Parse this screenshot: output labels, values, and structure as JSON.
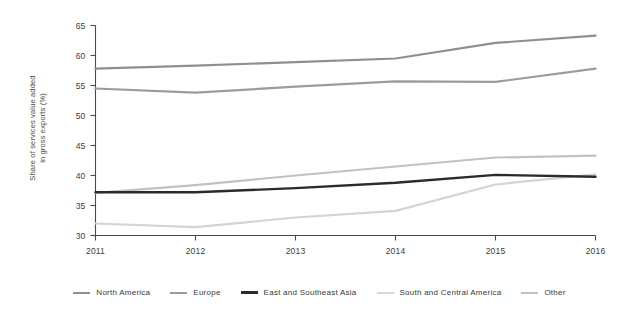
{
  "chart_data": {
    "type": "line",
    "title": "",
    "subtitle": "",
    "xlabel": "",
    "ylabel": "Share of services value added\nin gross exports (%)",
    "categories": [
      "2011",
      "2012",
      "2013",
      "2014",
      "2015",
      "2016"
    ],
    "x": [
      2011,
      2012,
      2013,
      2014,
      2015,
      2016
    ],
    "xlim": [
      2011,
      2016
    ],
    "ylim": [
      30,
      65
    ],
    "y_ticks": [
      30,
      35,
      40,
      45,
      50,
      55,
      60,
      65
    ],
    "grid": false,
    "legend_position": "bottom",
    "series": [
      {
        "name": "North America",
        "color": "#8f8f8f",
        "width": 2.2,
        "values": [
          57.8,
          58.3,
          58.9,
          59.5,
          62.1,
          63.3
        ]
      },
      {
        "name": "Europe",
        "color": "#9b9b9b",
        "width": 2.2,
        "values": [
          54.5,
          53.8,
          54.8,
          55.7,
          55.6,
          57.8
        ]
      },
      {
        "name": "East and Southeast Asia",
        "color": "#2b2b2b",
        "width": 2.4,
        "values": [
          37.2,
          37.2,
          37.9,
          38.8,
          40.1,
          39.8
        ]
      },
      {
        "name": "South and Central America",
        "color": "#d4d4d4",
        "width": 2.2,
        "values": [
          32.0,
          31.4,
          33.0,
          34.1,
          38.5,
          40.2
        ]
      },
      {
        "name": "Other",
        "color": "#c2c2c2",
        "width": 2.2,
        "values": [
          37.1,
          38.4,
          40.0,
          41.5,
          43.0,
          43.3
        ]
      }
    ]
  },
  "axis": {
    "y_tick_labels": [
      "65",
      "60",
      "55",
      "50",
      "45",
      "40",
      "35",
      "30"
    ],
    "x_tick_labels": [
      "2011",
      "2012",
      "2013",
      "2014",
      "2015",
      "2016"
    ],
    "y_title": "Share of services value added\nin gross exports (%)",
    "axis_color": "#4a4a4a"
  },
  "legend": {
    "items": [
      {
        "label": "North America",
        "color": "#8f8f8f",
        "thickness": "2px"
      },
      {
        "label": "Europe",
        "color": "#9b9b9b",
        "thickness": "2px"
      },
      {
        "label": "East and Southeast Asia",
        "color": "#2b2b2b",
        "thickness": "3px"
      },
      {
        "label": "South and Central America",
        "color": "#d9d9d9",
        "thickness": "2px"
      },
      {
        "label": "Other",
        "color": "#c2c2c2",
        "thickness": "2px"
      }
    ]
  }
}
